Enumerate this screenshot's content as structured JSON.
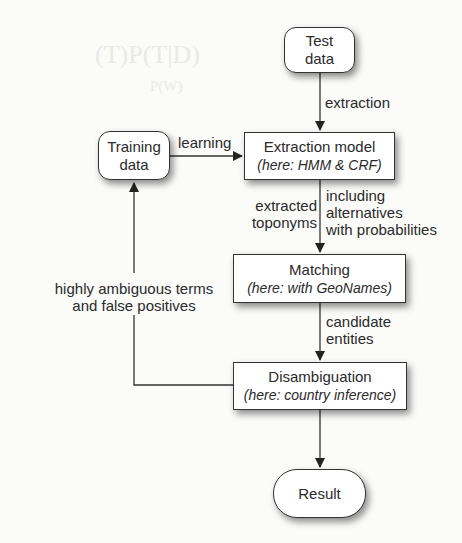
{
  "nodes": {
    "test_data": {
      "line1": "Test",
      "line2": "data"
    },
    "training_data": {
      "line1": "Training",
      "line2": "data"
    },
    "extraction_model": {
      "title": "Extraction model",
      "subtitle": "(here: HMM & CRF)"
    },
    "matching": {
      "title": "Matching",
      "subtitle": "(here: with GeoNames)"
    },
    "disambiguation": {
      "title": "Disambiguation",
      "subtitle": "(here: country inference)"
    },
    "result": {
      "title": "Result"
    }
  },
  "edges": {
    "extraction": "extraction",
    "learning": "learning",
    "extracted_toponyms": {
      "line1": "extracted",
      "line2": "toponyms"
    },
    "including_alternatives": {
      "line1": "including",
      "line2": "alternatives",
      "line3": "with probabilities"
    },
    "candidate_entities": {
      "line1": "candidate",
      "line2": "entities"
    },
    "feedback": {
      "line1": "highly ambiguous terms",
      "line2": "and false positives"
    }
  }
}
